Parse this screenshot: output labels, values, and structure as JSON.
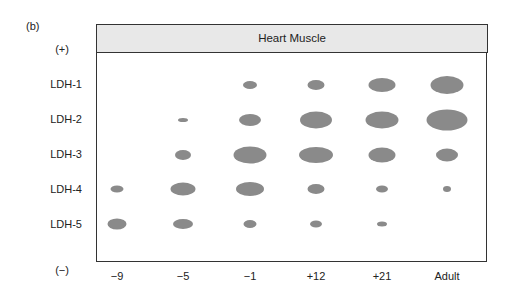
{
  "panel_label": "(b)",
  "header": {
    "title": "Heart Muscle"
  },
  "poles": {
    "positive": "(+)",
    "negative": "(−)"
  },
  "rows": [
    "LDH-1",
    "LDH-2",
    "LDH-3",
    "LDH-4",
    "LDH-5"
  ],
  "columns": [
    "−9",
    "−5",
    "−1",
    "+12",
    "+21",
    "Adult"
  ],
  "colors": {
    "spot": "#8a8a8a",
    "header_bg": "#e8e8e8",
    "frame": "#333333"
  },
  "chart_data": {
    "type": "heatmap",
    "title": "Heart Muscle",
    "xlabel": "Developmental stage",
    "ylabel": "LDH isozyme (electrophoretic position, + to −)",
    "categories_x": [
      "−9",
      "−5",
      "−1",
      "+12",
      "+21",
      "Adult"
    ],
    "categories_y": [
      "LDH-1",
      "LDH-2",
      "LDH-3",
      "LDH-4",
      "LDH-5"
    ],
    "spot_sizes_px": [
      [
        0,
        0,
        14,
        17,
        27,
        33
      ],
      [
        0,
        10,
        22,
        32,
        33,
        41
      ],
      [
        0,
        16,
        33,
        34,
        27,
        22
      ],
      [
        13,
        25,
        28,
        17,
        12,
        8
      ],
      [
        19,
        20,
        13,
        12,
        10,
        0
      ]
    ],
    "spot_heights_px": [
      [
        0,
        0,
        8,
        10,
        14,
        18
      ],
      [
        0,
        4,
        12,
        17,
        17,
        21
      ],
      [
        0,
        10,
        17,
        16,
        15,
        13
      ],
      [
        7,
        13,
        14,
        10,
        7,
        6
      ],
      [
        11,
        10,
        8,
        7,
        5,
        0
      ]
    ],
    "legend": {
      "top": "(+)",
      "bottom": "(−)"
    }
  }
}
